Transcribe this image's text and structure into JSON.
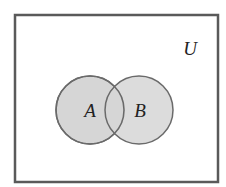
{
  "diagram": {
    "type": "venn",
    "universe_label": "U",
    "sets": [
      {
        "label": "A"
      },
      {
        "label": "B"
      }
    ],
    "colors": {
      "border": "#5a5a5a",
      "fill": "#d6d6d6",
      "background": "#ffffff"
    }
  }
}
